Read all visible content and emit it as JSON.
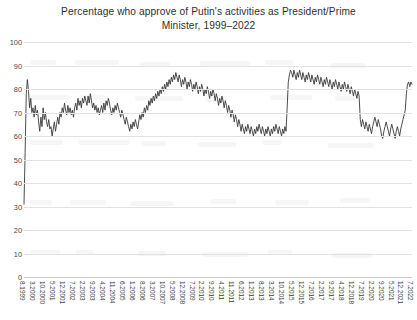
{
  "chart_data": {
    "type": "line",
    "title": "Percentage who approve of Putin's activities as President/Prime Minister, 1999–2022",
    "title_line1": "Percentage who approve of Putin's activities as President/Prime",
    "title_line2": "Minister, 1999–2022",
    "xlabel": "",
    "ylabel": "",
    "ylim": [
      0,
      100
    ],
    "ytick_labels": [
      "0",
      "10",
      "20",
      "30",
      "40",
      "50",
      "60",
      "70",
      "80",
      "90",
      "100"
    ],
    "ytick_values": [
      0,
      10,
      20,
      30,
      40,
      50,
      60,
      70,
      80,
      90,
      100
    ],
    "grid": true,
    "legend": "none",
    "line_color": "#3a3a3a",
    "grid_color": "#e2e2e2",
    "background_color": "#ffffff",
    "xtick_labels": [
      "8.1999",
      "3.2000",
      "10.2000",
      "5.2001",
      "12.2001",
      "7.2002",
      "2.2003",
      "9.2003",
      "4.2004",
      "11.2004",
      "6.2005",
      "1.2006",
      "8.2006",
      "3.2007",
      "10.2007",
      "5.2008",
      "12.2008",
      "7.2009",
      "2.2010",
      "9.2010",
      "4.2011",
      "11.2011",
      "6.2012",
      "1.2013",
      "8.2013",
      "3.2014",
      "10.2014",
      "5.2015",
      "12.2015",
      "7.2016",
      "2.2017",
      "9.2017",
      "4.2018",
      "12.2018",
      "7.2019",
      "2.2020",
      "9.2020",
      "5.2021",
      "12.2021",
      "7.2022"
    ],
    "xtick_interval_months": 7,
    "x_start": "8.1999",
    "x_end": "7.2022",
    "series": [
      {
        "name": "Approval of Putin",
        "values": [
          31,
          53,
          78,
          84,
          79,
          72,
          76,
          70,
          72,
          68,
          73,
          69,
          71,
          66,
          62,
          68,
          64,
          72,
          67,
          70,
          66,
          64,
          67,
          63,
          64,
          60,
          63,
          66,
          62,
          65,
          68,
          65,
          70,
          68,
          72,
          70,
          74,
          71,
          69,
          73,
          70,
          72,
          69,
          71,
          68,
          72,
          74,
          71,
          76,
          73,
          75,
          72,
          76,
          74,
          77,
          75,
          73,
          77,
          74,
          78,
          75,
          72,
          74,
          71,
          73,
          70,
          72,
          69,
          71,
          73,
          70,
          74,
          71,
          75,
          73,
          76,
          74,
          71,
          69,
          72,
          70,
          73,
          71,
          74,
          72,
          70,
          68,
          71,
          69,
          67,
          65,
          68,
          66,
          64,
          62,
          65,
          63,
          66,
          64,
          67,
          65,
          63,
          66,
          69,
          67,
          70,
          68,
          72,
          70,
          73,
          71,
          75,
          73,
          76,
          74,
          77,
          75,
          78,
          76,
          79,
          77,
          80,
          78,
          81,
          79,
          82,
          80,
          83,
          81,
          84,
          82,
          85,
          83,
          86,
          84,
          87,
          85,
          83,
          86,
          84,
          81,
          84,
          82,
          85,
          83,
          80,
          83,
          81,
          84,
          82,
          79,
          82,
          80,
          83,
          81,
          78,
          81,
          79,
          82,
          80,
          77,
          80,
          78,
          81,
          79,
          76,
          79,
          77,
          80,
          78,
          75,
          78,
          76,
          73,
          76,
          74,
          77,
          75,
          72,
          75,
          73,
          70,
          73,
          71,
          68,
          71,
          69,
          66,
          69,
          67,
          64,
          67,
          65,
          62,
          65,
          63,
          61,
          64,
          62,
          65,
          63,
          61,
          64,
          62,
          60,
          63,
          61,
          64,
          62,
          65,
          63,
          61,
          64,
          62,
          60,
          63,
          61,
          64,
          62,
          60,
          63,
          61,
          64,
          62,
          65,
          63,
          61,
          64,
          62,
          60,
          63,
          61,
          64,
          62,
          72,
          83,
          86,
          88,
          87,
          85,
          88,
          86,
          84,
          87,
          85,
          88,
          86,
          84,
          87,
          85,
          83,
          86,
          84,
          87,
          85,
          83,
          86,
          84,
          82,
          85,
          83,
          86,
          84,
          82,
          85,
          83,
          81,
          84,
          82,
          85,
          83,
          81,
          84,
          82,
          80,
          83,
          81,
          84,
          82,
          80,
          83,
          81,
          79,
          82,
          80,
          83,
          81,
          79,
          82,
          80,
          78,
          81,
          79,
          77,
          80,
          78,
          76,
          79,
          77,
          67,
          64,
          67,
          65,
          63,
          66,
          64,
          62,
          65,
          63,
          61,
          64,
          66,
          68,
          66,
          64,
          67,
          65,
          63,
          60,
          59,
          62,
          64,
          66,
          64,
          62,
          60,
          63,
          65,
          63,
          61,
          59,
          62,
          64,
          62,
          60,
          63,
          65,
          67,
          69,
          71,
          78,
          82,
          83,
          81,
          83,
          82
        ]
      }
    ],
    "annotations": [
      {
        "label": "start 8.1999 low",
        "value": 31
      },
      {
        "label": "2008 peak",
        "value": 88
      },
      {
        "label": "2011–2013 trough",
        "value": 60
      },
      {
        "label": "2014 Crimea jump",
        "value": 88
      },
      {
        "label": "2020 low",
        "value": 59
      },
      {
        "label": "2022 rise",
        "value": 83
      }
    ]
  }
}
